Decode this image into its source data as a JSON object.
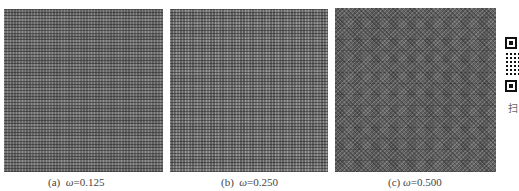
{
  "figure": {
    "panels": [
      {
        "id": "a",
        "label": "(a)",
        "symbol": "ω",
        "equals": "=0.125",
        "omega": 0.125
      },
      {
        "id": "b",
        "label": "(b)",
        "symbol": "ω",
        "equals": "=0.250",
        "omega": 0.25
      },
      {
        "id": "c",
        "label": "(c)",
        "symbol": "ω",
        "equals": "=0.500",
        "omega": 0.5
      }
    ],
    "side": {
      "qr_icon": "qr-code-icon",
      "label": "扫"
    }
  }
}
